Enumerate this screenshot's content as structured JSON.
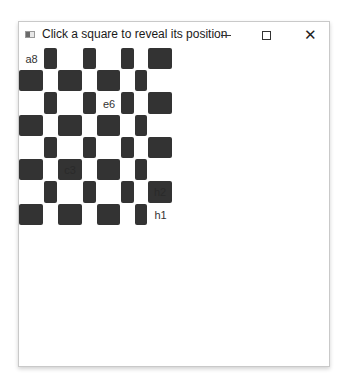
{
  "window": {
    "title": "Click a square to reveal its position",
    "controls": {
      "minimize": "minimize-icon",
      "maximize": "maximize-icon",
      "close": "close-icon"
    }
  },
  "board": {
    "files": [
      "a",
      "b",
      "c",
      "d",
      "e",
      "f",
      "g",
      "h"
    ],
    "ranks": [
      8,
      7,
      6,
      5,
      4,
      3,
      2,
      1
    ],
    "column_edges": [
      0,
      25,
      39,
      64,
      78,
      102,
      116,
      129,
      154
    ],
    "row_edges": [
      0,
      22,
      44,
      67,
      89,
      111,
      133,
      156,
      178
    ],
    "dark_color": "#333333",
    "light_color": "#ffffff",
    "revealed": {
      "a8": "a8",
      "e6": "e6",
      "c3": "c3",
      "h2": "h2",
      "h1": "h1"
    }
  }
}
